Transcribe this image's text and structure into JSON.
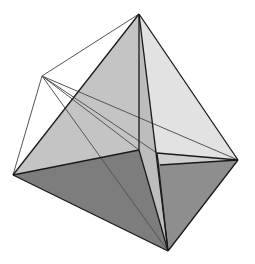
{
  "diagram": {
    "title": "Stellated tetrahedral solid (wireframe with shaded faces)",
    "vertices": {
      "top": [
        139,
        14
      ],
      "upper_left": [
        42,
        76
      ],
      "left": [
        13,
        175
      ],
      "right": [
        238,
        160
      ],
      "bottom": [
        168,
        251
      ],
      "center": [
        139,
        150
      ],
      "inner_right": [
        157,
        153
      ]
    },
    "colors": {
      "background": "#ffffff",
      "face_light": "#e4e4e4",
      "face_mid_light": "#c9c9c9",
      "face_mid": "#b8b8b8",
      "face_dark": "#7a7a7a",
      "face_darker": "#8c8c8c",
      "edge_dark": "#1a1a1a",
      "edge_light": "#555555"
    }
  }
}
